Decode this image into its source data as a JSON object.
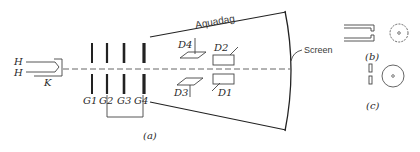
{
  "diagram": {
    "type": "cathode-ray-tube-schematic",
    "labels": {
      "heater_top": "H",
      "heater_bottom": "H",
      "cathode": "K",
      "grids": [
        "G1",
        "G2",
        "G3",
        "G4"
      ],
      "plates": [
        "D1",
        "D2",
        "D3",
        "D4"
      ],
      "aquadag": "Aquadag",
      "screen": "Screen",
      "panel_a": "(a)",
      "panel_b": "(b)",
      "panel_c": "(c)"
    }
  }
}
